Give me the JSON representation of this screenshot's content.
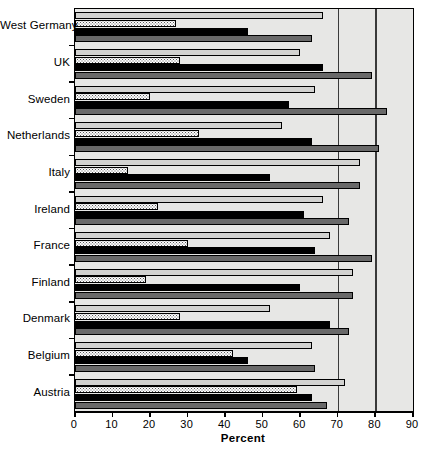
{
  "chart_data": {
    "type": "bar",
    "orientation": "horizontal",
    "title": "",
    "xlabel": "Percent",
    "ylabel": "",
    "xlim": [
      0,
      90
    ],
    "xticks": [
      0,
      10,
      20,
      30,
      40,
      50,
      60,
      70,
      80,
      90
    ],
    "xtick_labels": [
      "0",
      "10",
      "20",
      "30",
      "40",
      "50",
      "60",
      "70",
      "80",
      "90"
    ],
    "grid": true,
    "gridlines_at": [
      70,
      80
    ],
    "legend": "none",
    "categories": [
      "West Germany",
      "UK",
      "Sweden",
      "Netherlands",
      "Italy",
      "Ireland",
      "France",
      "Finland",
      "Denmark",
      "Belgium",
      "Austria"
    ],
    "series": [
      {
        "name": "series-1",
        "style": "light-gray",
        "color": "#d2d2d0",
        "values": [
          66,
          60,
          64,
          55,
          76,
          66,
          68,
          74,
          52,
          63,
          72
        ]
      },
      {
        "name": "series-2",
        "style": "dotted",
        "color": "#fbfbfb",
        "values": [
          27,
          28,
          20,
          33,
          14,
          22,
          30,
          19,
          28,
          42,
          59
        ]
      },
      {
        "name": "series-3",
        "style": "black",
        "color": "#000000",
        "values": [
          46,
          66,
          57,
          63,
          52,
          61,
          64,
          60,
          68,
          46,
          63
        ]
      },
      {
        "name": "series-4",
        "style": "dark-gray",
        "color": "#696969",
        "values": [
          63,
          79,
          83,
          81,
          76,
          73,
          79,
          74,
          73,
          64,
          67
        ]
      }
    ]
  },
  "axis": {
    "x_title": "Percent"
  }
}
